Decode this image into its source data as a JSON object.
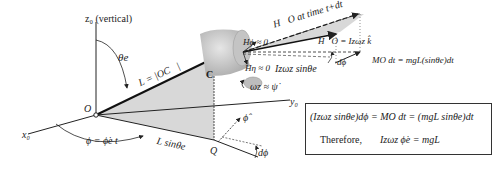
{
  "diagram": {
    "labels": {
      "z_axis": "z₀ (vertical)",
      "x_axis": "x₀",
      "y_axis": "y₀",
      "theta_e": "θe",
      "L_eq": "L = |OC⃗|",
      "O": "O",
      "C": "C",
      "Q": "Q",
      "phi_eq": "ϕ = ϕ̇e t",
      "L_sin": "L sinθe",
      "phi_hat": "ϕ̂",
      "dphi_bottom": "dϕ",
      "H_phi": "Hϕ ≈ 0",
      "H_eta": "Hη ≈ 0",
      "omega": "ωz ≈ ψ̇",
      "H_time": "H⃗O at time t+dt",
      "H_O": "H⃗O = Izωz k̂",
      "Iz_sin": "Izωz sinθe",
      "dphi_top": "dϕ",
      "MO_eq": "MO dt = mgL(sinθe)dt"
    },
    "box": {
      "line1": "(Izωz sinθe)dϕ = MO dt = (mgL sinθe)dt",
      "line2_prefix": "Therefore,",
      "line2_eq": "Izωz ϕ̇e = mgL"
    },
    "colors": {
      "shade": "#d8d8d8",
      "cylinder": "#cfcfcf",
      "line": "#222222"
    }
  }
}
